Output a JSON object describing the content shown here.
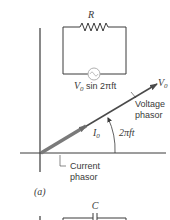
{
  "figure": {
    "panel_label": "(a)",
    "circuit_top": {
      "resistor_label": "R",
      "source_label_prefix": "V",
      "source_label_sub": "0",
      "source_label_suffix": " sin 2πft"
    },
    "phasor_diagram": {
      "voltage_tip_label": "V",
      "voltage_tip_sub": "0",
      "voltage_caption_line1": "Voltage",
      "voltage_caption_line2": "phasor",
      "current_label": "I",
      "current_sub": "0",
      "angle_label": "2πft",
      "current_caption_line1": "Current",
      "current_caption_line2": "phasor"
    },
    "circuit_bottom": {
      "capacitor_label": "C"
    },
    "colors": {
      "line": "#3a3a3a",
      "voltage_phasor": "#4a4a4a",
      "current_phasor": "#7a7a7a",
      "source_circle": "#b0b0b0"
    }
  }
}
